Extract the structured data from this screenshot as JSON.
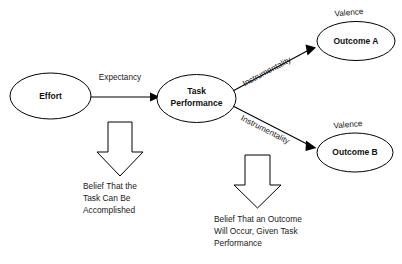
{
  "diagram": {
    "background_color": "#ffffff",
    "stroke_color": "#000000",
    "text_color": "#1a1a1a",
    "nodes": [
      {
        "id": "effort",
        "label": "Effort",
        "shape": "ellipse"
      },
      {
        "id": "task_performance",
        "label_line1": "Task",
        "label_line2": "Performance",
        "shape": "ellipse"
      },
      {
        "id": "outcome_a",
        "label": "Outcome A",
        "shape": "ellipse"
      },
      {
        "id": "outcome_b",
        "label": "Outcome B",
        "shape": "ellipse"
      }
    ],
    "edges": [
      {
        "id": "effort_to_performance",
        "label": "Expectancy",
        "from": "effort",
        "to": "task_performance"
      },
      {
        "id": "performance_to_outcome_a",
        "label": "Instrumentality",
        "from": "task_performance",
        "to": "outcome_a"
      },
      {
        "id": "performance_to_outcome_b",
        "label": "Instrumentality",
        "from": "task_performance",
        "to": "outcome_b"
      }
    ],
    "annotations": [
      {
        "id": "valence_a",
        "label": "Valence",
        "attached_to": "outcome_a"
      },
      {
        "id": "valence_b",
        "label": "Valence",
        "attached_to": "outcome_b"
      }
    ],
    "callouts": [
      {
        "id": "expectancy_definition",
        "arrow": "block-arrow-down",
        "lines": [
          "Belief That the",
          "Task Can Be",
          "Accomplished"
        ]
      },
      {
        "id": "instrumentality_definition",
        "arrow": "block-arrow-down",
        "lines": [
          "Belief That an Outcome",
          "Will Occur, Given Task",
          "Performance"
        ]
      }
    ]
  }
}
